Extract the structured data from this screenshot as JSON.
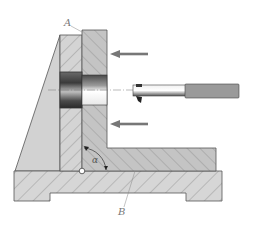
{
  "diagram": {
    "type": "mechanical cross-section",
    "labels": {
      "a": "A",
      "b": "B",
      "angle": "α"
    },
    "components": [
      {
        "name": "fixed support bracket",
        "hatched": false
      },
      {
        "name": "vertical plate A",
        "hatched": true
      },
      {
        "name": "movable angle plate with bore",
        "hatched": true
      },
      {
        "name": "base B",
        "hatched": true
      },
      {
        "name": "boring tool",
        "hatched": false
      }
    ],
    "arrows": [
      {
        "direction": "left",
        "position": "upper"
      },
      {
        "direction": "left",
        "position": "lower"
      }
    ],
    "colors": {
      "stroke": "#555555",
      "fill_light": "#d2d2d2",
      "fill_mid": "#bdbdbd",
      "hatch": "#8a8a8a",
      "arrow": "#777777",
      "tool_shank": "#9a9a9a"
    }
  }
}
